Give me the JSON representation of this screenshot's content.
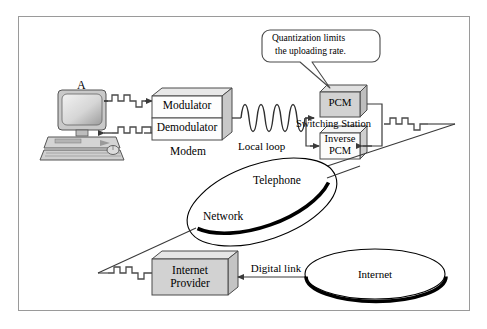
{
  "diagram": {
    "type": "network-diagram",
    "title_visible": false,
    "callout": {
      "line1": "Quantization limits",
      "line2": "the uploading rate."
    },
    "labels": {
      "station_a": "A",
      "modulator": "Modulator",
      "demodulator": "Demodulator",
      "modem": "Modem",
      "local_loop": "Local  loop",
      "pcm": "PCM",
      "inverse_pcm_line1": "Inverse",
      "inverse_pcm_line2": "PCM",
      "switching_station": "Switching Station",
      "telephone": "Telephone",
      "network": "Network",
      "internet_provider_line1": "Internet",
      "internet_provider_line2": "Provider",
      "digital_link": "Digital link",
      "internet": "Internet"
    },
    "colors": {
      "frame_border": "#9a9a9a",
      "line": "#3a3a3a",
      "box_fill_gray": "#d2d2d2",
      "box_fill_white": "#fdfdfd",
      "box_top_face": "#e8e8e8",
      "box_side_face": "#c2c2c2",
      "ellipse_stroke": "#111111",
      "ellipse_shadow": "#000000",
      "text": "#000000",
      "signal_stroke": "#4a4a4a",
      "computer_body": "#cfcfcf"
    },
    "signals": {
      "digital_label": "square-wave pulse train",
      "analog_label": "sine wave",
      "analog_cycles": 5
    }
  }
}
